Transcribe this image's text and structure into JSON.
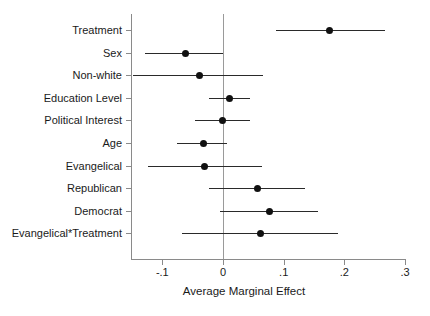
{
  "chart_data": {
    "type": "scatter",
    "title": "",
    "subtitle": "",
    "xlabel": "Average Marginal Effect",
    "ylabel": "",
    "xlim": [
      -0.155,
      0.3
    ],
    "xticks": [
      -0.1,
      0,
      0.1,
      0.2,
      0.3
    ],
    "xticklabels": [
      "-.1",
      "0",
      ".1",
      ".2",
      ".3"
    ],
    "grid": false,
    "legend": null,
    "reference_line": 0,
    "categories": [
      "Treatment",
      "Sex",
      "Non-white",
      "Education Level",
      "Political Interest",
      "Age",
      "Evangelical",
      "Republican",
      "Democrat",
      "Evangelical*Treatment"
    ],
    "series": [
      {
        "name": "Average Marginal Effect",
        "estimates": [
          0.176,
          -0.061,
          -0.038,
          0.01,
          -0.001,
          -0.032,
          -0.03,
          0.057,
          0.076,
          0.061
        ],
        "ci_low": [
          0.088,
          -0.129,
          -0.148,
          -0.023,
          -0.046,
          -0.075,
          -0.124,
          -0.023,
          -0.005,
          -0.067
        ],
        "ci_high": [
          0.267,
          0.0,
          0.066,
          0.044,
          0.044,
          0.007,
          0.065,
          0.135,
          0.157,
          0.19
        ]
      }
    ],
    "points": [
      {
        "label": "Treatment",
        "estimate": 0.176,
        "ci_low": 0.088,
        "ci_high": 0.267
      },
      {
        "label": "Sex",
        "estimate": -0.061,
        "ci_low": -0.129,
        "ci_high": 0.0
      },
      {
        "label": "Non-white",
        "estimate": -0.038,
        "ci_low": -0.148,
        "ci_high": 0.066
      },
      {
        "label": "Education Level",
        "estimate": 0.01,
        "ci_low": -0.023,
        "ci_high": 0.044
      },
      {
        "label": "Political Interest",
        "estimate": -0.001,
        "ci_low": -0.046,
        "ci_high": 0.044
      },
      {
        "label": "Age",
        "estimate": -0.032,
        "ci_low": -0.075,
        "ci_high": 0.007
      },
      {
        "label": "Evangelical",
        "estimate": -0.03,
        "ci_low": -0.124,
        "ci_high": 0.065
      },
      {
        "label": "Republican",
        "estimate": 0.057,
        "ci_low": -0.023,
        "ci_high": 0.135
      },
      {
        "label": "Democrat",
        "estimate": 0.076,
        "ci_low": -0.005,
        "ci_high": 0.157
      },
      {
        "label": "Evangelical*Treatment",
        "estimate": 0.061,
        "ci_low": -0.067,
        "ci_high": 0.19
      }
    ],
    "colors": {
      "point": "#111111",
      "ci": "#2a2a2a",
      "axis": "#8a8a8a",
      "zero_line": "#9a9a9a",
      "background": "#ffffff",
      "text": "#1a1a1a"
    }
  }
}
